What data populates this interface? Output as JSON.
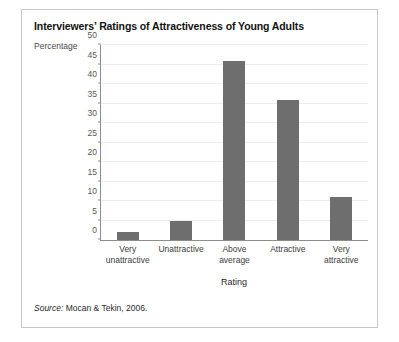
{
  "figure": {
    "title": "Interviewers’ Ratings of Attractiveness of Young Adults",
    "source_label": "Source:",
    "source_text": " Mocan & Tekin, 2006."
  },
  "chart_data": {
    "type": "bar",
    "title": "Interviewers’ Ratings of Attractiveness of Young Adults",
    "xlabel": "Rating",
    "ylabel": "Percentage",
    "categories": [
      "Very unattractive",
      "Unattractive",
      "Above average",
      "Attractive",
      "Very attractive"
    ],
    "category_lines": [
      [
        "Very",
        "unattractive"
      ],
      [
        "Unattractive",
        ""
      ],
      [
        "Above",
        "average"
      ],
      [
        "Attractive",
        ""
      ],
      [
        "Very",
        "attractive"
      ]
    ],
    "values": [
      2,
      5,
      46,
      36,
      11
    ],
    "ylim": [
      0,
      50
    ],
    "ytick_values": [
      0,
      5,
      10,
      15,
      20,
      25,
      30,
      35,
      40,
      45,
      50
    ],
    "ytick_labels": [
      "0",
      "5",
      "10",
      "15",
      "20",
      "25",
      "30",
      "35",
      "40",
      "45",
      "50"
    ],
    "grid": true,
    "legend": "none",
    "bar_color": "#6e6e6e",
    "axis_color": "#8c8c8c",
    "grid_color": "#ededed"
  }
}
